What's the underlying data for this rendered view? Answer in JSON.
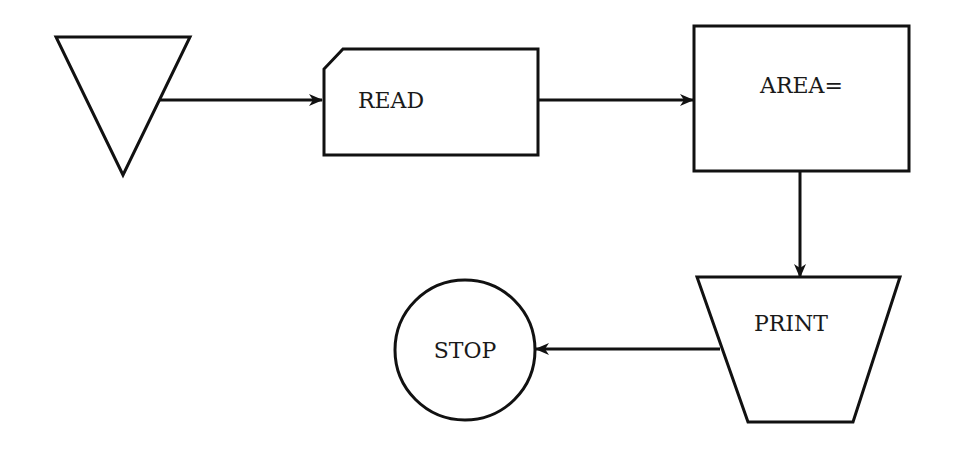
{
  "diagram": {
    "type": "flowchart",
    "colors": {
      "stroke": "#111111",
      "background": "#ffffff",
      "text": "#1a1a1a"
    },
    "nodes": [
      {
        "id": "start",
        "shape": "inverted-triangle",
        "label": ""
      },
      {
        "id": "read",
        "shape": "punched-card",
        "label": "READ"
      },
      {
        "id": "area",
        "shape": "rectangle",
        "label": "AREA="
      },
      {
        "id": "print",
        "shape": "trapezoid",
        "label": "PRINT"
      },
      {
        "id": "stop",
        "shape": "circle",
        "label": "STOP"
      }
    ],
    "edges": [
      {
        "from": "start",
        "to": "read"
      },
      {
        "from": "read",
        "to": "area"
      },
      {
        "from": "area",
        "to": "print"
      },
      {
        "from": "print",
        "to": "stop"
      }
    ]
  }
}
